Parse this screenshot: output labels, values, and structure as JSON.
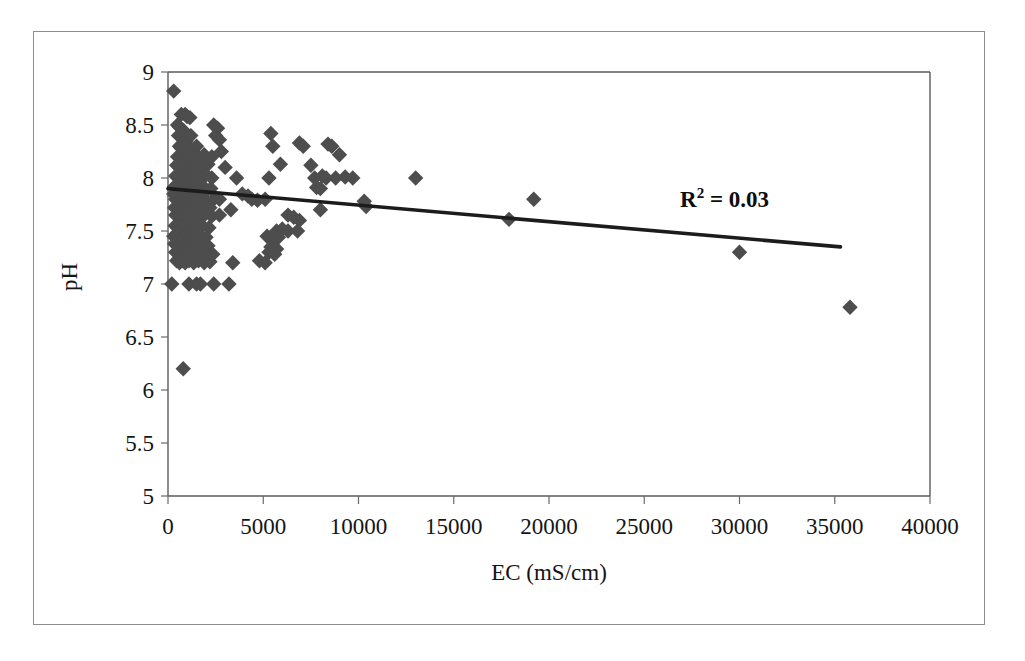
{
  "figure": {
    "kind": "scatter-plot",
    "has_outer_border": true
  },
  "chart_data": {
    "type": "scatter",
    "title": "",
    "xlabel": "EC (mS/cm)",
    "ylabel": "pH",
    "xlim": [
      0,
      40000
    ],
    "ylim": [
      5,
      9
    ],
    "xticks": [
      0,
      5000,
      10000,
      15000,
      20000,
      25000,
      30000,
      35000,
      40000
    ],
    "xtick_labels": [
      "0",
      "5000",
      "10000",
      "15000",
      "20000",
      "25000",
      "30000",
      "35000",
      "40000"
    ],
    "yticks": [
      5,
      5.5,
      6,
      6.5,
      7,
      7.5,
      8,
      8.5,
      9
    ],
    "ytick_labels": [
      "5",
      "5.5",
      "6",
      "6.5",
      "7",
      "7.5",
      "8",
      "8.5",
      "9"
    ],
    "grid": false,
    "legend": null,
    "marker": "diamond",
    "marker_color": "#4d4d4d",
    "marker_size": 9,
    "annotations": [
      {
        "name": "r-squared",
        "base_text": "R",
        "superscript": "2",
        "rest_text": " = 0.03",
        "full_text": "R2 = 0.03",
        "x": 28500,
        "y": 8.05
      }
    ],
    "trendline": {
      "type": "linear",
      "r_squared": 0.03,
      "x_start": 0,
      "y_start": 7.9,
      "x_end": 35300,
      "y_end": 7.35,
      "color": "#1c1c1c"
    },
    "points": [
      [
        300,
        8.82
      ],
      [
        700,
        8.6
      ],
      [
        900,
        8.6
      ],
      [
        1000,
        8.58
      ],
      [
        1150,
        8.57
      ],
      [
        500,
        8.5
      ],
      [
        600,
        8.48
      ],
      [
        800,
        8.45
      ],
      [
        2400,
        8.5
      ],
      [
        2600,
        8.47
      ],
      [
        550,
        8.4
      ],
      [
        750,
        8.38
      ],
      [
        950,
        8.35
      ],
      [
        1200,
        8.4
      ],
      [
        2500,
        8.4
      ],
      [
        2700,
        8.36
      ],
      [
        5400,
        8.42
      ],
      [
        5500,
        8.3
      ],
      [
        600,
        8.3
      ],
      [
        700,
        8.28
      ],
      [
        850,
        8.25
      ],
      [
        1000,
        8.3
      ],
      [
        1250,
        8.27
      ],
      [
        1500,
        8.3
      ],
      [
        6900,
        8.33
      ],
      [
        7100,
        8.3
      ],
      [
        8400,
        8.32
      ],
      [
        8600,
        8.3
      ],
      [
        9000,
        8.22
      ],
      [
        500,
        8.2
      ],
      [
        650,
        8.19
      ],
      [
        800,
        8.21
      ],
      [
        900,
        8.18
      ],
      [
        1100,
        8.2
      ],
      [
        1300,
        8.18
      ],
      [
        1600,
        8.2
      ],
      [
        1900,
        8.22
      ],
      [
        2300,
        8.2
      ],
      [
        2800,
        8.25
      ],
      [
        450,
        8.12
      ],
      [
        600,
        8.1
      ],
      [
        700,
        8.12
      ],
      [
        850,
        8.1
      ],
      [
        1000,
        8.11
      ],
      [
        1150,
        8.09
      ],
      [
        1350,
        8.12
      ],
      [
        1550,
        8.1
      ],
      [
        1800,
        8.1
      ],
      [
        2100,
        8.13
      ],
      [
        3000,
        8.1
      ],
      [
        5900,
        8.13
      ],
      [
        7500,
        8.12
      ],
      [
        8800,
        8.0
      ],
      [
        400,
        8.02
      ],
      [
        520,
        8.0
      ],
      [
        640,
        8.01
      ],
      [
        760,
        8.0
      ],
      [
        880,
        8.02
      ],
      [
        1000,
        8.0
      ],
      [
        1120,
        8.01
      ],
      [
        1300,
        8.0
      ],
      [
        1500,
        8.02
      ],
      [
        1700,
        8.0
      ],
      [
        2000,
        8.03
      ],
      [
        2300,
        8.0
      ],
      [
        3600,
        8.0
      ],
      [
        5300,
        8.0
      ],
      [
        7700,
        8.0
      ],
      [
        8100,
        8.02
      ],
      [
        8300,
        8.0
      ],
      [
        9300,
        8.01
      ],
      [
        9700,
        8.0
      ],
      [
        13000,
        8.0
      ],
      [
        350,
        7.92
      ],
      [
        480,
        7.9
      ],
      [
        600,
        7.91
      ],
      [
        720,
        7.9
      ],
      [
        840,
        7.92
      ],
      [
        960,
        7.9
      ],
      [
        1100,
        7.91
      ],
      [
        1250,
        7.9
      ],
      [
        1450,
        7.92
      ],
      [
        1650,
        7.9
      ],
      [
        1900,
        7.91
      ],
      [
        2250,
        7.9
      ],
      [
        7800,
        7.91
      ],
      [
        8000,
        7.9
      ],
      [
        300,
        7.85
      ],
      [
        420,
        7.83
      ],
      [
        560,
        7.85
      ],
      [
        680,
        7.84
      ],
      [
        800,
        7.85
      ],
      [
        920,
        7.83
      ],
      [
        1050,
        7.85
      ],
      [
        1200,
        7.84
      ],
      [
        1400,
        7.85
      ],
      [
        1600,
        7.83
      ],
      [
        1850,
        7.85
      ],
      [
        3900,
        7.85
      ],
      [
        4200,
        7.83
      ],
      [
        400,
        7.8
      ],
      [
        550,
        7.78
      ],
      [
        700,
        7.8
      ],
      [
        820,
        7.79
      ],
      [
        950,
        7.8
      ],
      [
        1100,
        7.78
      ],
      [
        1300,
        7.8
      ],
      [
        1500,
        7.79
      ],
      [
        1750,
        7.8
      ],
      [
        2050,
        7.78
      ],
      [
        2400,
        7.8
      ],
      [
        2700,
        7.8
      ],
      [
        4400,
        7.8
      ],
      [
        4700,
        7.79
      ],
      [
        5100,
        7.8
      ],
      [
        10300,
        7.78
      ],
      [
        19200,
        7.8
      ],
      [
        350,
        7.72
      ],
      [
        500,
        7.7
      ],
      [
        650,
        7.72
      ],
      [
        780,
        7.7
      ],
      [
        900,
        7.71
      ],
      [
        1050,
        7.7
      ],
      [
        1200,
        7.72
      ],
      [
        1400,
        7.7
      ],
      [
        1650,
        7.71
      ],
      [
        1950,
        7.7
      ],
      [
        2200,
        7.72
      ],
      [
        3300,
        7.7
      ],
      [
        8000,
        7.7
      ],
      [
        10400,
        7.73
      ],
      [
        400,
        7.65
      ],
      [
        550,
        7.63
      ],
      [
        700,
        7.65
      ],
      [
        850,
        7.63
      ],
      [
        1000,
        7.65
      ],
      [
        1150,
        7.64
      ],
      [
        1350,
        7.65
      ],
      [
        1600,
        7.63
      ],
      [
        1900,
        7.65
      ],
      [
        2300,
        7.64
      ],
      [
        2700,
        7.65
      ],
      [
        6300,
        7.65
      ],
      [
        6600,
        7.63
      ],
      [
        6900,
        7.6
      ],
      [
        17900,
        7.61
      ],
      [
        380,
        7.55
      ],
      [
        520,
        7.53
      ],
      [
        660,
        7.55
      ],
      [
        800,
        7.54
      ],
      [
        950,
        7.55
      ],
      [
        1100,
        7.53
      ],
      [
        1300,
        7.55
      ],
      [
        1550,
        7.54
      ],
      [
        1800,
        7.55
      ],
      [
        2150,
        7.53
      ],
      [
        5700,
        7.5
      ],
      [
        6000,
        7.52
      ],
      [
        6300,
        7.5
      ],
      [
        6800,
        7.5
      ],
      [
        300,
        7.45
      ],
      [
        450,
        7.44
      ],
      [
        600,
        7.45
      ],
      [
        750,
        7.43
      ],
      [
        900,
        7.45
      ],
      [
        1050,
        7.44
      ],
      [
        1250,
        7.45
      ],
      [
        1450,
        7.43
      ],
      [
        1700,
        7.45
      ],
      [
        2000,
        7.44
      ],
      [
        5200,
        7.45
      ],
      [
        5500,
        7.42
      ],
      [
        5800,
        7.44
      ],
      [
        350,
        7.38
      ],
      [
        500,
        7.36
      ],
      [
        650,
        7.38
      ],
      [
        800,
        7.36
      ],
      [
        950,
        7.38
      ],
      [
        1100,
        7.36
      ],
      [
        1300,
        7.38
      ],
      [
        1500,
        7.36
      ],
      [
        1750,
        7.38
      ],
      [
        2100,
        7.36
      ],
      [
        5400,
        7.35
      ],
      [
        5700,
        7.33
      ],
      [
        400,
        7.3
      ],
      [
        550,
        7.28
      ],
      [
        700,
        7.3
      ],
      [
        850,
        7.28
      ],
      [
        1000,
        7.3
      ],
      [
        1200,
        7.29
      ],
      [
        1400,
        7.3
      ],
      [
        1650,
        7.28
      ],
      [
        1950,
        7.3
      ],
      [
        2350,
        7.28
      ],
      [
        5300,
        7.3
      ],
      [
        5600,
        7.28
      ],
      [
        30000,
        7.3
      ],
      [
        450,
        7.22
      ],
      [
        600,
        7.2
      ],
      [
        750,
        7.22
      ],
      [
        900,
        7.2
      ],
      [
        1100,
        7.22
      ],
      [
        1350,
        7.2
      ],
      [
        1600,
        7.22
      ],
      [
        1900,
        7.2
      ],
      [
        2200,
        7.21
      ],
      [
        3400,
        7.2
      ],
      [
        4800,
        7.22
      ],
      [
        5100,
        7.2
      ],
      [
        200,
        7.0
      ],
      [
        1100,
        7.0
      ],
      [
        1500,
        7.0
      ],
      [
        1700,
        7.0
      ],
      [
        2400,
        7.0
      ],
      [
        3200,
        7.0
      ],
      [
        800,
        6.2
      ],
      [
        35800,
        6.78
      ]
    ]
  }
}
